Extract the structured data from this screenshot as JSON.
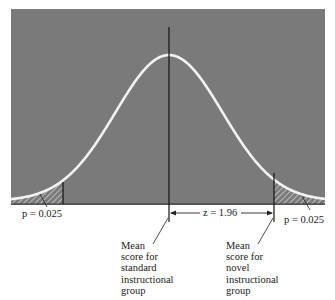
{
  "figure": {
    "type": "normal-distribution",
    "panel_color": "#7a7a7a",
    "curve_color": "#f2f2f2",
    "line_color": "#111111",
    "z_value": 1.96,
    "tail_probability": 0.025
  },
  "labels": {
    "left_tail": "p = 0.025",
    "right_tail": "p = 0.025",
    "z_distance": "z = 1.96",
    "standard_mean": [
      "Mean",
      "score for",
      "standard",
      "instructional",
      "group"
    ],
    "novel_mean": [
      "Mean",
      "score for",
      "novel",
      "instructional",
      "group"
    ]
  }
}
